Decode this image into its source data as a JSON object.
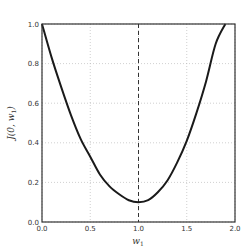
{
  "chart_data": {
    "type": "line",
    "title": "",
    "xlabel": "w_1",
    "ylabel": "J(0, w_1)",
    "xlim": [
      0.0,
      2.0
    ],
    "ylim": [
      0.0,
      1.0
    ],
    "xticks": [
      "0.0",
      "0.5",
      "1.0",
      "1.5",
      "2.0"
    ],
    "yticks": [
      "0.0",
      "0.2",
      "0.4",
      "0.6",
      "0.8",
      "1.0"
    ],
    "grid": true,
    "legend": null,
    "vline": {
      "x": 1.0,
      "style": "dashed"
    },
    "series": [
      {
        "name": "J(0, w_1)",
        "color": "#1a1a1a",
        "x": [
          0.0,
          0.1,
          0.2,
          0.3,
          0.4,
          0.5,
          0.6,
          0.7,
          0.8,
          0.9,
          1.0,
          1.1,
          1.2,
          1.3,
          1.4,
          1.5,
          1.6,
          1.7,
          1.8,
          1.9
        ],
        "values": [
          1.0,
          0.83,
          0.68,
          0.54,
          0.42,
          0.33,
          0.24,
          0.18,
          0.14,
          0.11,
          0.1,
          0.11,
          0.15,
          0.21,
          0.3,
          0.41,
          0.55,
          0.71,
          0.9,
          1.0
        ]
      }
    ]
  },
  "labels": {
    "xlabel": "w",
    "xlabel_sub": "1",
    "ylabel": "J(0, w",
    "ylabel_sub": "1",
    "ylabel_close": ")"
  }
}
